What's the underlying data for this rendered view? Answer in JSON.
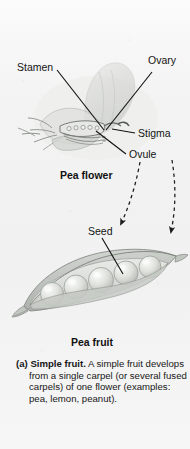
{
  "figure": {
    "panel_id": "(a)",
    "background_color": "#f3f3f3",
    "ink_color": "#141414"
  },
  "flower": {
    "title": "Pea flower",
    "labels": [
      {
        "id": "stamen",
        "text": "Stamen"
      },
      {
        "id": "ovary",
        "text": "Ovary"
      },
      {
        "id": "stigma",
        "text": "Stigma"
      },
      {
        "id": "ovule",
        "text": "Ovule"
      }
    ]
  },
  "fruit": {
    "title": "Pea fruit",
    "labels": [
      {
        "id": "seed",
        "text": "Seed"
      }
    ],
    "seed_count": 5
  },
  "transition": {
    "arrow_style": "dashed",
    "arrow_count": 2,
    "meaning": "ovary develops into fruit; ovule develops into seed"
  },
  "caption": {
    "marker": "(a)",
    "term": "Simple fruit.",
    "body": "A simple fruit develops from a single carpel (or several fused carpels) of one flower (examples: pea, lemon, peanut)."
  }
}
